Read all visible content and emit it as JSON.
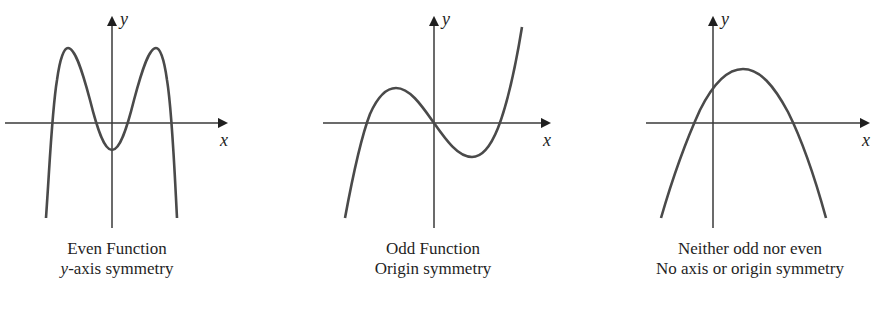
{
  "figures": [
    {
      "id": "even",
      "title": "Even Function",
      "subtitle_prefix_italic": "y",
      "subtitle_rest": "-axis symmetry",
      "x_axis_label": "x",
      "y_axis_label": "y"
    },
    {
      "id": "odd",
      "title": "Odd Function",
      "subtitle": "Origin symmetry",
      "x_axis_label": "x",
      "y_axis_label": "y"
    },
    {
      "id": "neither",
      "title": "Neither odd nor even",
      "subtitle": "No axis or origin symmetry",
      "x_axis_label": "x",
      "y_axis_label": "y"
    }
  ],
  "colors": {
    "curve": "#4a4a4a",
    "axis": "#3a3a3a",
    "text": "#1f1f1f"
  }
}
